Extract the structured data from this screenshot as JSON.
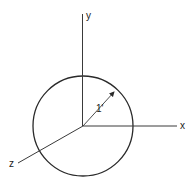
{
  "diagram": {
    "title": "",
    "axes": {
      "x_label": "x",
      "y_label": "y",
      "z_label": "z"
    },
    "sphere": {
      "radius_label": "1'"
    },
    "colors": {
      "stroke": "#2a2a2a",
      "background": "#ffffff"
    }
  }
}
